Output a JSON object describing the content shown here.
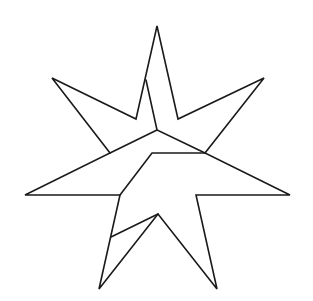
{
  "figure": {
    "stroke_color": "#1a1a1a",
    "background_color": "#ffffff",
    "outline_points": [
      [
        157,
        26
      ],
      [
        178,
        119
      ],
      [
        264,
        78
      ],
      [
        205,
        153
      ],
      [
        290,
        195
      ],
      [
        196,
        195
      ],
      [
        217,
        289
      ],
      [
        158,
        214
      ],
      [
        99,
        289
      ],
      [
        120,
        195
      ],
      [
        25,
        195
      ],
      [
        110,
        153
      ],
      [
        52,
        78
      ],
      [
        136,
        119
      ]
    ],
    "internal_lines": [
      [
        [
          146,
          80
        ],
        [
          157,
          130
        ],
        [
          205,
          153
        ]
      ],
      [
        [
          157,
          130
        ],
        [
          110,
          153
        ]
      ],
      [
        [
          120,
          195
        ],
        [
          152,
          153
        ],
        [
          205,
          153
        ]
      ],
      [
        [
          111,
          237
        ],
        [
          158,
          214
        ]
      ]
    ]
  }
}
